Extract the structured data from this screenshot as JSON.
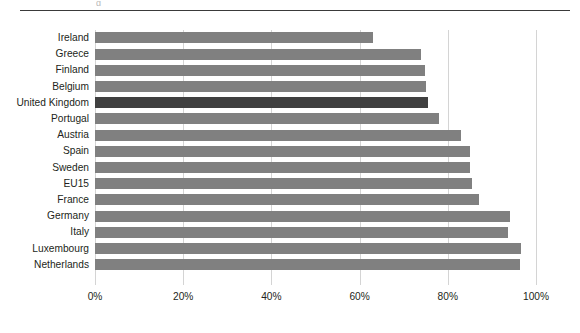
{
  "chart_data": {
    "type": "bar",
    "orientation": "horizontal",
    "title": "",
    "subtitle": "",
    "xlabel": "",
    "ylabel": "",
    "xlim": [
      0,
      100
    ],
    "x_unit": "%",
    "grid": true,
    "grid_axis": "x",
    "legend": "none",
    "categories": [
      "Ireland",
      "Greece",
      "Finland",
      "Belgium",
      "United Kingdom",
      "Portugal",
      "Austria",
      "Spain",
      "Sweden",
      "EU15",
      "France",
      "Germany",
      "Italy",
      "Luxembourg",
      "Netherlands"
    ],
    "values": [
      63,
      74,
      74.8,
      75,
      75.5,
      78,
      83,
      85,
      85,
      85.5,
      87,
      94,
      93.7,
      96.6,
      96.4
    ],
    "value_labels": [
      "63%",
      "74%",
      "75%",
      "75%",
      "76%",
      "78%",
      "83%",
      "85%",
      "85%",
      "86%",
      "87%",
      "94%",
      "94%",
      "97%",
      "96%"
    ],
    "highlighted_category": "United Kingdom",
    "xticks": [
      0,
      20,
      40,
      60,
      80,
      100
    ],
    "xtick_labels": [
      "0%",
      "20%",
      "40%",
      "60%",
      "80%",
      "100%"
    ],
    "colors": {
      "bar": "#808080",
      "bar_highlight": "#404040",
      "gridline": "#d4d4d4",
      "text": "#231f20",
      "top_rule": "#3a3a3a",
      "background": "#ffffff"
    }
  },
  "decoration": {
    "clipped_descender": "g"
  }
}
